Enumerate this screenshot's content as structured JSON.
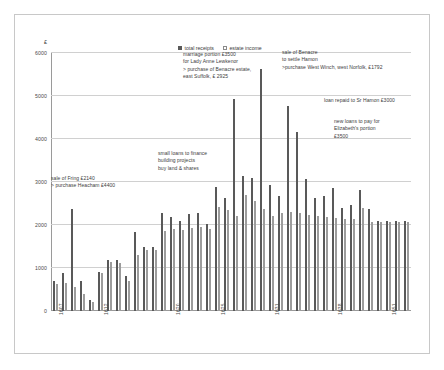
{
  "chart_data": {
    "type": "bar",
    "title": "",
    "subtitle": "",
    "xlabel": "",
    "ylabel": "£",
    "ylim": [
      0,
      6000
    ],
    "ytick_values": [
      0,
      1000,
      2000,
      3000,
      4000,
      5000,
      6000
    ],
    "ytick_labels": [
      "0",
      "1000",
      "2000",
      "3000",
      "4000",
      "5000",
      "6000"
    ],
    "grid": true,
    "legend_position": "top-center",
    "x": [
      "1607",
      "1608",
      "1609",
      "1610",
      "1611",
      "1612",
      "1613",
      "1614",
      "1615",
      "1616",
      "1617",
      "1618",
      "1619",
      "1620",
      "1621",
      "1622",
      "1623",
      "1624",
      "1625",
      "1626",
      "1627",
      "1628",
      "1629",
      "1630",
      "1631",
      "1632",
      "1633",
      "1634",
      "1635",
      "1636",
      "1637",
      "1638",
      "1639",
      "1640",
      "1641",
      "1642",
      "1643",
      "1651",
      "1652",
      "1653"
    ],
    "xtick_labels": [
      "1607",
      "1612",
      "1620",
      "1625",
      "1631",
      "1638",
      "1651"
    ],
    "xtick_indices": [
      0,
      5,
      13,
      18,
      24,
      31,
      37
    ],
    "series": [
      {
        "name": "total receipts",
        "color": "#595959",
        "values": [
          700,
          880,
          2370,
          700,
          250,
          900,
          1180,
          1180,
          820,
          1830,
          1480,
          1500,
          2280,
          2180,
          2100,
          2250,
          2280,
          2020,
          2880,
          2620,
          4920,
          3150,
          3100,
          5620,
          2930,
          2680,
          4760,
          4160,
          3060,
          2630,
          2680,
          2850,
          2400,
          2460,
          2820,
          2380,
          2100,
          2100,
          2100,
          2100
        ]
      },
      {
        "name": "estate income",
        "color": "#ffffff",
        "values": [
          620,
          640,
          560,
          390,
          220,
          880,
          1150,
          1120,
          700,
          1300,
          1420,
          1430,
          1860,
          1900,
          1880,
          1940,
          1950,
          1900,
          2420,
          2360,
          2200,
          2700,
          2560,
          2370,
          2200,
          2280,
          2300,
          2270,
          2230,
          2200,
          2180,
          2160,
          2140,
          2130,
          2400,
          2080,
          2060,
          2060,
          2060,
          2060
        ]
      }
    ],
    "annotations": [
      {
        "id": "marriage-portion",
        "text": "marriage portion £3500\nfor Lady Anne Lewkenor\n> purchase of Benacre estate,\neast Suffolk, £ 2925",
        "x": 182,
        "y": 50
      },
      {
        "id": "sale-of-benacre",
        "text": "sale of Benacre\nto settle Hamon\n>purchase West Winch, west Norfolk, £1792",
        "x": 281,
        "y": 48
      },
      {
        "id": "loan-repaid",
        "text": "loan repaid to Sr Hamon £3000",
        "x": 323,
        "y": 96
      },
      {
        "id": "new-loans",
        "text": "new loans to pay for\nElizabeth's portion\n£3500",
        "x": 333,
        "y": 117
      },
      {
        "id": "small-loans",
        "text": "small loans to finance\nbuilding  projects\nbuy  land & shares",
        "x": 157,
        "y": 149
      },
      {
        "id": "sale-of-fring",
        "text": "sale of Fring £2140\n> purchase Heacham £4400",
        "x": 50,
        "y": 174
      }
    ]
  }
}
